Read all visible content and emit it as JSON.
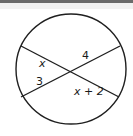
{
  "figure": {
    "stroke_color": "#1f1f1f",
    "background": "#ffffff",
    "circle": {
      "cx": 71,
      "cy": 69,
      "r": 55
    },
    "chords": [
      {
        "name": "chord-1",
        "x1": 21,
        "y1": 46,
        "x2": 119,
        "y2": 97
      },
      {
        "name": "chord-2",
        "x1": 21,
        "y1": 97,
        "x2": 120,
        "y2": 46
      }
    ],
    "intersection": {
      "x": 70,
      "y": 71
    }
  },
  "labels": {
    "upper_left_segment": "x",
    "upper_right_segment": "4",
    "lower_left_segment": "3",
    "lower_right_segment": "x + 2"
  }
}
